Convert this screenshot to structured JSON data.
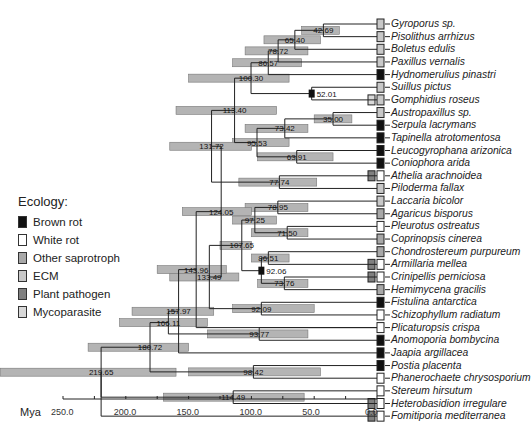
{
  "legend": {
    "title": "Ecology:",
    "items": [
      {
        "label": "Brown rot",
        "color": "#111111"
      },
      {
        "label": "White rot",
        "color": "#ffffff"
      },
      {
        "label": "Other saprotroph",
        "color": "#a8a8a8"
      },
      {
        "label": "ECM",
        "color": "#c8c8c8"
      },
      {
        "label": "Plant pathogen",
        "color": "#808080"
      },
      {
        "label": "Mycoparasite",
        "color": "#d8d8d8"
      }
    ]
  },
  "axis": {
    "unit_label": "Mya",
    "ticks": [
      "250.0",
      "200.0",
      "150.0",
      "100.0",
      "50.0",
      "0.0"
    ]
  },
  "taxa": [
    {
      "name": "Gyroporus sp.",
      "ecology": "ECM"
    },
    {
      "name": "Pisolithus arrhizus",
      "ecology": "ECM"
    },
    {
      "name": "Boletus edulis",
      "ecology": "ECM"
    },
    {
      "name": "Paxillus vernalis",
      "ecology": "ECM"
    },
    {
      "name": "Hydnomerulius pinastri",
      "ecology": "Brown rot"
    },
    {
      "name": "Suillus pictus",
      "ecology": "ECM"
    },
    {
      "name": "Gomphidius roseus",
      "ecology": "ECM",
      "extra": "Mycoparasite"
    },
    {
      "name": "Austropaxillus sp.",
      "ecology": "ECM"
    },
    {
      "name": "Serpula lacrymans",
      "ecology": "Brown rot"
    },
    {
      "name": "Tapinella atrotomentosa",
      "ecology": "Brown rot"
    },
    {
      "name": "Leucogyrophana arizonica",
      "ecology": "Brown rot"
    },
    {
      "name": "Coniophora arida",
      "ecology": "Brown rot"
    },
    {
      "name": "Athelia arachnoidea",
      "ecology": "White rot",
      "extra": "Plant pathogen"
    },
    {
      "name": "Piloderma fallax",
      "ecology": "ECM"
    },
    {
      "name": "Laccaria bicolor",
      "ecology": "ECM"
    },
    {
      "name": "Agaricus bisporus",
      "ecology": "Other saprotroph"
    },
    {
      "name": "Pleurotus ostreatus",
      "ecology": "White rot"
    },
    {
      "name": "Coprinopsis cinerea",
      "ecology": "Other saprotroph"
    },
    {
      "name": "Chondrostereum purpureum",
      "ecology": "Other saprotroph"
    },
    {
      "name": "Armillaria mellea",
      "ecology": "White rot",
      "extra": "Plant pathogen"
    },
    {
      "name": "Crinipellis perniciosa",
      "ecology": "White rot",
      "extra": "Plant pathogen"
    },
    {
      "name": "Hemimycena gracilis",
      "ecology": "Other saprotroph"
    },
    {
      "name": "Fistulina antarctica",
      "ecology": "Brown rot"
    },
    {
      "name": "Schizophyllum radiatum",
      "ecology": "White rot"
    },
    {
      "name": "Plicaturopsis crispa",
      "ecology": "White rot"
    },
    {
      "name": "Anomoporia bombycina",
      "ecology": "Brown rot"
    },
    {
      "name": "Jaapia argillacea",
      "ecology": "Brown rot"
    },
    {
      "name": "Postia placenta",
      "ecology": "Brown rot"
    },
    {
      "name": "Phanerochaete chrysosporium",
      "ecology": "White rot"
    },
    {
      "name": "Stereum hirsutum",
      "ecology": "White rot"
    },
    {
      "name": "Heterobasidion irregulare",
      "ecology": "White rot",
      "extra": "Plant pathogen"
    },
    {
      "name": "Fomitiporia mediterranea",
      "ecology": "White rot",
      "extra": "Plant pathogen"
    }
  ],
  "nodes": [
    {
      "age": "42.69",
      "lo": 30,
      "hi": 60
    },
    {
      "age": "65.40",
      "lo": 45,
      "hi": 90
    },
    {
      "age": "78.72",
      "lo": 55,
      "hi": 105
    },
    {
      "age": "86.57",
      "lo": 60,
      "hi": 115
    },
    {
      "age": "100.30",
      "lo": 70,
      "hi": 150
    },
    {
      "age": "52.01",
      "lo": 52,
      "hi": 52
    },
    {
      "age": "113.40",
      "lo": 80,
      "hi": 160
    },
    {
      "age": "35.00",
      "lo": 20,
      "hi": 50
    },
    {
      "age": "73.42",
      "lo": 55,
      "hi": 105
    },
    {
      "age": "95.53",
      "lo": 70,
      "hi": 115
    },
    {
      "age": "63.91",
      "lo": 35,
      "hi": 95
    },
    {
      "age": "131.72",
      "lo": 100,
      "hi": 165
    },
    {
      "age": "77.74",
      "lo": 48,
      "hi": 110
    },
    {
      "age": "78.95",
      "lo": 55,
      "hi": 105
    },
    {
      "age": "97.25",
      "lo": 80,
      "hi": 115
    },
    {
      "age": "71.50",
      "lo": 55,
      "hi": 100
    },
    {
      "age": "107.65",
      "lo": 100,
      "hi": 125
    },
    {
      "age": "143.96",
      "lo": 120,
      "hi": 175
    },
    {
      "age": "86.51",
      "lo": 70,
      "hi": 100
    },
    {
      "age": "92.06",
      "lo": 92,
      "hi": 92
    },
    {
      "age": "73.76",
      "lo": 55,
      "hi": 95
    },
    {
      "age": "124.05",
      "lo": 100,
      "hi": 155
    },
    {
      "age": "157.97",
      "lo": 130,
      "hi": 195
    },
    {
      "age": "133.49",
      "lo": 110,
      "hi": 165
    },
    {
      "age": "92.09",
      "lo": 50,
      "hi": 115
    },
    {
      "age": "166.11",
      "lo": 135,
      "hi": 205
    },
    {
      "age": "93.77",
      "lo": 55,
      "hi": 135
    },
    {
      "age": "180.72",
      "lo": 150,
      "hi": 230
    },
    {
      "age": "98.42",
      "lo": 45,
      "hi": 150
    },
    {
      "age": "219.65",
      "lo": 160,
      "hi": 300
    },
    {
      "age": "114.49",
      "lo": 58,
      "hi": 170
    }
  ]
}
